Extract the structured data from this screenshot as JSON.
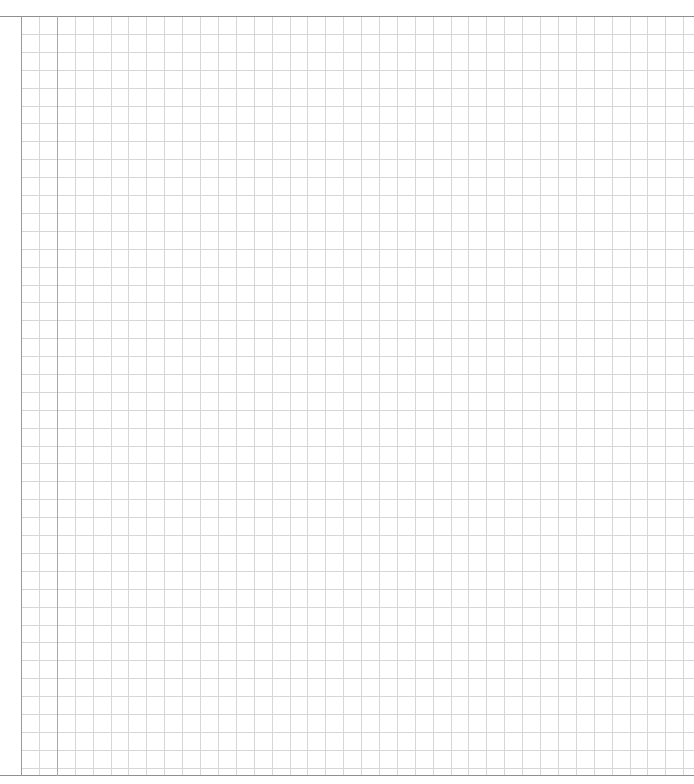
{
  "page": {
    "type": "graph-paper",
    "grid_spacing_px": 17.9,
    "grid_color": "#d6d6d6",
    "margin_line_color": "#a8a8a8",
    "border_color": "#8f8f8f",
    "background": "#ffffff"
  }
}
